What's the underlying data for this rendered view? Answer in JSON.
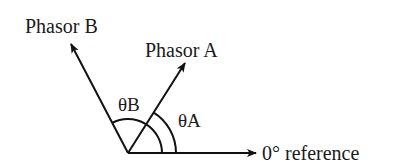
{
  "diagram": {
    "type": "phasor-diagram",
    "labels": {
      "phasor_b": "Phasor B",
      "phasor_a": "Phasor A",
      "theta_b": "θB",
      "theta_a": "θA",
      "reference": "0° reference"
    },
    "origin": [
      128,
      153
    ],
    "vectors": [
      {
        "name": "Phasor B",
        "tip": [
          70,
          42
        ],
        "angle_deg": 118
      },
      {
        "name": "Phasor A",
        "tip": [
          186,
          61
        ],
        "angle_deg": 58
      },
      {
        "name": "0° reference",
        "tip": [
          256,
          153
        ],
        "angle_deg": 0
      }
    ],
    "arcs": [
      {
        "name": "θB",
        "radius": 34,
        "from_deg": 0,
        "to_deg": 118
      },
      {
        "name": "θA",
        "radius": 48,
        "from_deg": 0,
        "to_deg": 58
      }
    ],
    "colors": {
      "stroke": "#111111",
      "background": "#ffffff"
    }
  }
}
